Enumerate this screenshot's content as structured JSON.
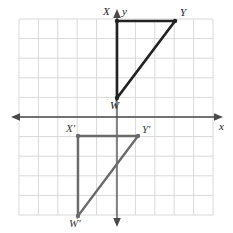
{
  "figure": {
    "kind": "coordinate-plane-transformation",
    "background": "#ffffff",
    "grid": {
      "show": true,
      "color": "#d9d9d9",
      "cell_px": 19.4,
      "x_range_px": [
        19,
        213
      ],
      "y_range_px": [
        19,
        215
      ],
      "cols": 10,
      "rows": 10
    },
    "axes": {
      "color": "#4a4a4a",
      "x_axis_label": "x",
      "y_axis_label": "y",
      "origin_px": [
        117,
        117
      ],
      "x_axis_y_px": 117,
      "y_axis_x_px": 117,
      "arrows": [
        "left",
        "right",
        "up",
        "down"
      ]
    },
    "shapes": [
      {
        "name": "triangle-WXY",
        "role": "preimage",
        "color": "#222222",
        "stroke_px": 2.6,
        "vertices": [
          {
            "label": "X",
            "x_px": 117,
            "y_px": 21,
            "grid": [
              0,
              5
            ],
            "label_dx": -12,
            "label_dy": -13
          },
          {
            "label": "Y",
            "x_px": 175,
            "y_px": 21,
            "grid": [
              3,
              5
            ],
            "label_dx": 5,
            "label_dy": -13
          },
          {
            "label": "W",
            "x_px": 117,
            "y_px": 98,
            "grid": [
              0,
              1
            ],
            "label_dx": -4,
            "label_dy": 3
          }
        ]
      },
      {
        "name": "triangle-W-prime-X-prime-Y-prime",
        "role": "image",
        "color": "#6a6a6a",
        "stroke_px": 2.4,
        "vertices": [
          {
            "label": "X'",
            "x_px": 78,
            "y_px": 136,
            "grid": [
              -2,
              -1
            ],
            "label_dx": -10,
            "label_dy": -13
          },
          {
            "label": "Y'",
            "x_px": 138,
            "y_px": 136,
            "grid": [
              1,
              -1
            ],
            "label_dx": 5,
            "label_dy": -13
          },
          {
            "label": "W'",
            "x_px": 78,
            "y_px": 216,
            "grid": [
              -2,
              -5
            ],
            "label_dx": -5,
            "label_dy": 3
          }
        ]
      }
    ],
    "labels": {
      "X": "X",
      "Y": "Y",
      "W": "W",
      "X_prime": "X'",
      "Y_prime": "Y'",
      "W_prime": "W'",
      "x_axis": "x",
      "y_axis": "y"
    }
  }
}
